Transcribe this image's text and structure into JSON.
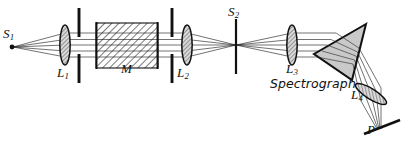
{
  "figure": {
    "kind": "optical-ray-diagram",
    "width": 402,
    "height": 145,
    "background_color": "#ffffff",
    "ink_color": "#111111",
    "prism_fill_color": "#c8c8c8",
    "lens_fill_color": "#b5b5b5"
  },
  "labels": {
    "source": "S",
    "source_sub": "1",
    "lens1": "L",
    "lens1_sub": "1",
    "sample": "M",
    "lens2": "L",
    "lens2_sub": "2",
    "slit": "S",
    "slit_sub": "2",
    "lens3": "L",
    "lens3_sub": "3",
    "spectrograph": "Spectrograph",
    "lens4": "L",
    "lens4_sub": "4",
    "plate": "P"
  },
  "components": [
    {
      "name": "point-source",
      "label": "S1",
      "type": "source-dot",
      "x": 12,
      "y": 47
    },
    {
      "name": "lens-1",
      "label": "L1",
      "type": "converging-lens",
      "x": 65,
      "y": 45
    },
    {
      "name": "aperture-1",
      "label": "",
      "type": "aperture-stop",
      "x": 79,
      "y": 45
    },
    {
      "name": "sample-cell-m",
      "label": "M",
      "type": "hatched-block",
      "x": 96,
      "y": 23,
      "width": 62,
      "height": 45
    },
    {
      "name": "aperture-2",
      "label": "",
      "type": "aperture-stop",
      "x": 172,
      "y": 45
    },
    {
      "name": "lens-2",
      "label": "L2",
      "type": "converging-lens",
      "x": 187,
      "y": 45
    },
    {
      "name": "slit-s2",
      "label": "S2",
      "type": "slit",
      "x": 236,
      "y": 45
    },
    {
      "name": "lens-3",
      "label": "L3",
      "type": "converging-lens",
      "x": 292,
      "y": 45
    },
    {
      "name": "prism",
      "label": "",
      "type": "dispersing-prism",
      "x": 340,
      "y": 50
    },
    {
      "name": "lens-4",
      "label": "L4",
      "type": "converging-lens",
      "x": 370,
      "y": 97
    },
    {
      "name": "photographic-plate",
      "label": "P",
      "type": "plate",
      "x": 385,
      "y": 128
    }
  ]
}
